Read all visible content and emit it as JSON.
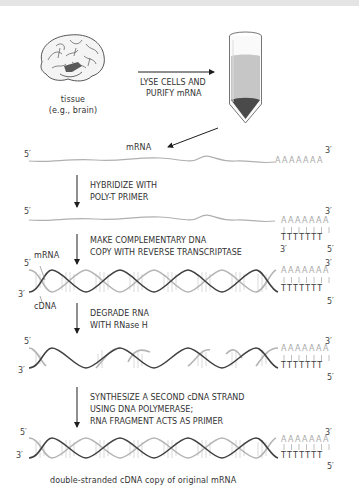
{
  "figure": {
    "source": {
      "label_line1": "tissue",
      "label_line2": "(e.g., brain)",
      "icon": "brain-icon"
    },
    "tube": {
      "icon": "test-tube-icon",
      "colors": {
        "supernatant": "#c4c4c4",
        "pellet": "#4a4a4a"
      }
    },
    "step0": {
      "line1": "LYSE CELLS AND",
      "line2": "PURIFY mRNA"
    },
    "row1": {
      "left_end": "5′",
      "right_end": "3′",
      "label": "mRNA",
      "poly_a": "AAAAAAA"
    },
    "step1": {
      "line1": "HYBRIDIZE WITH",
      "line2": "POLY-T PRIMER"
    },
    "row2": {
      "left_end": "5′",
      "right_end_top": "3′",
      "poly_a": "AAAAAAA",
      "poly_t": "TTTTTTT",
      "primer_left": "3′",
      "primer_right": "5′"
    },
    "step2": {
      "line1": "MAKE COMPLEMENTARY DNA",
      "line2": "COPY WITH REVERSE TRANSCRIPTASE"
    },
    "row3": {
      "mrna_label": "mRNA",
      "cdna_label": "cDNA",
      "left_top": "5′",
      "left_bottom": "3′",
      "right_top": "3′",
      "right_bottom": "5′",
      "poly_a": "AAAAAAA",
      "poly_t": "TTTTTTT"
    },
    "step3": {
      "line1": "DEGRADE RNA",
      "line2": "WITH RNase H"
    },
    "row4": {
      "left_top": "5′",
      "left_bottom": "3′",
      "right_top": "3′",
      "right_bottom": "5′",
      "poly_a": "AAAAAAA",
      "poly_t": "TTTTTTT"
    },
    "step4": {
      "line1": "SYNTHESIZE A SECOND cDNA STRAND",
      "line2": "USING DNA POLYMERASE;",
      "line3": "RNA FRAGMENT ACTS AS PRIMER"
    },
    "row5": {
      "left_top": "5′",
      "left_bottom": "3′",
      "right_top": "3′",
      "right_bottom": "5′",
      "poly_a": "AAAAAAA",
      "poly_t": "TTTTTTT"
    },
    "caption": "double-stranded cDNA copy of original mRNA",
    "colors": {
      "rna": "#b4b4b4",
      "dna": "#404040",
      "arrow": "#1e1e1e",
      "background": "#ffffff"
    }
  }
}
